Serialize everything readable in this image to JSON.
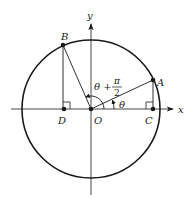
{
  "diagram": {
    "type": "unit-circle",
    "axes": {
      "x_label": "x",
      "y_label": "y"
    },
    "points": [
      {
        "name": "A",
        "label": "A"
      },
      {
        "name": "B",
        "label": "B"
      },
      {
        "name": "C",
        "label": "C"
      },
      {
        "name": "D",
        "label": "D"
      },
      {
        "name": "O",
        "label": "O"
      }
    ],
    "angles": {
      "theta": "θ",
      "theta_plus": "θ +",
      "pi": "π",
      "two": "2"
    },
    "colors": {
      "stroke": "#1a1a1a",
      "axis": "#333333"
    }
  }
}
